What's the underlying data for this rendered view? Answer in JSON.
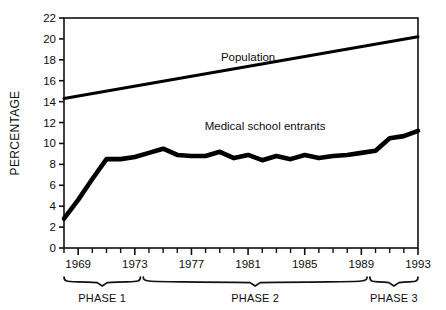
{
  "chart_data": {
    "type": "line",
    "title": "",
    "xlabel": "",
    "ylabel": "PERCENTAGE",
    "xlim": [
      1968,
      1993
    ],
    "ylim": [
      0,
      22
    ],
    "ytick_step": 2,
    "grid": false,
    "legend": "inline-annotations",
    "yticks": [
      "0",
      "2",
      "4",
      "6",
      "8",
      "10",
      "12",
      "14",
      "16",
      "18",
      "20",
      "22"
    ],
    "ytick_values": [
      0,
      2,
      4,
      6,
      8,
      10,
      12,
      14,
      16,
      18,
      20,
      22
    ],
    "xticks_major": [
      "1969",
      "1973",
      "1977",
      "1981",
      "1985",
      "1989",
      "1993"
    ],
    "xtick_major_values": [
      1969,
      1973,
      1977,
      1981,
      1985,
      1989,
      1993
    ],
    "xtick_minor_values": [
      1968,
      1970,
      1971,
      1972,
      1974,
      1975,
      1976,
      1978,
      1979,
      1980,
      1982,
      1983,
      1984,
      1986,
      1987,
      1988,
      1990,
      1991,
      1992
    ],
    "series": [
      {
        "name": "Population",
        "label": "Population",
        "label_x": 1981.0,
        "label_y": 17.9,
        "color": "#000000",
        "x": [
          1968,
          1993
        ],
        "values": [
          14.3,
          20.2
        ]
      },
      {
        "name": "Medical school entrants",
        "label": "Medical school entrants",
        "label_x": 1982.2,
        "label_y": 11.3,
        "color": "#000000",
        "x": [
          1968,
          1969,
          1970,
          1971,
          1972,
          1973,
          1974,
          1975,
          1976,
          1977,
          1978,
          1979,
          1980,
          1981,
          1982,
          1983,
          1984,
          1985,
          1986,
          1987,
          1988,
          1989,
          1990,
          1991,
          1992,
          1993
        ],
        "values": [
          2.8,
          4.6,
          6.6,
          8.5,
          8.5,
          8.7,
          9.1,
          9.5,
          8.9,
          8.8,
          8.8,
          9.2,
          8.6,
          8.9,
          8.4,
          8.8,
          8.5,
          8.9,
          8.6,
          8.8,
          8.9,
          9.1,
          9.3,
          10.5,
          10.7,
          11.2
        ]
      }
    ],
    "phases": [
      {
        "label": "PHASE 1",
        "start": 1968.0,
        "end": 1973.4
      },
      {
        "label": "PHASE 2",
        "start": 1973.6,
        "end": 1989.4
      },
      {
        "label": "PHASE 3",
        "start": 1989.6,
        "end": 1993.0
      }
    ]
  }
}
